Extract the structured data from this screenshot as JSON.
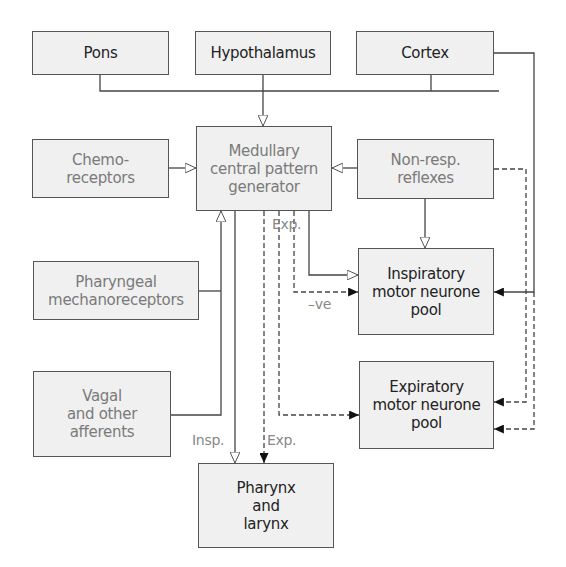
{
  "diagram": {
    "type": "flowchart",
    "nodes": {
      "pons": {
        "lines": [
          "Pons"
        ]
      },
      "hypothalamus": {
        "lines": [
          "Hypothalamus"
        ]
      },
      "cortex": {
        "lines": [
          "Cortex"
        ]
      },
      "cpg": {
        "lines": [
          "Medullary",
          "central pattern",
          "generator"
        ]
      },
      "chemoreceptors": {
        "lines": [
          "Chemo-",
          "receptors"
        ]
      },
      "nonresp": {
        "lines": [
          "Non-resp.",
          "reflexes"
        ]
      },
      "pharyngeal": {
        "lines": [
          "Pharyngeal",
          "mechanoreceptors"
        ]
      },
      "vagal": {
        "lines": [
          "Vagal",
          "and other",
          "afferents"
        ]
      },
      "inspiratory": {
        "lines": [
          "Inspiratory",
          "motor neurone",
          "pool"
        ]
      },
      "expiratory": {
        "lines": [
          "Expiratory",
          "motor neurone",
          "pool"
        ]
      },
      "pharynx": {
        "lines": [
          "Pharynx",
          "and",
          "larynx"
        ]
      }
    },
    "labels": {
      "exp_upper": "Exp.",
      "neg": "–ve",
      "insp_lower": "Insp.",
      "exp_lower": "Exp."
    },
    "edges": [
      {
        "from": "pons",
        "to": "cpg",
        "style": "solid",
        "head": "open"
      },
      {
        "from": "hypothalamus",
        "to": "cpg",
        "style": "solid",
        "head": "open"
      },
      {
        "from": "cortex",
        "to": "cpg",
        "style": "solid",
        "head": "open"
      },
      {
        "from": "chemoreceptors",
        "to": "cpg",
        "style": "solid",
        "head": "open"
      },
      {
        "from": "nonresp",
        "to": "cpg",
        "style": "solid",
        "head": "open"
      },
      {
        "from": "pharyngeal",
        "to": "cpg",
        "style": "solid",
        "head": "open"
      },
      {
        "from": "vagal",
        "to": "cpg",
        "style": "solid",
        "head": "open"
      },
      {
        "from": "nonresp",
        "to": "inspiratory",
        "style": "solid",
        "head": "open"
      },
      {
        "from": "cpg",
        "to": "inspiratory",
        "style": "solid",
        "head": "open"
      },
      {
        "from": "cpg",
        "to": "inspiratory",
        "style": "dashed",
        "head": "filled",
        "label": "Exp. / –ve"
      },
      {
        "from": "cortex",
        "to": "inspiratory",
        "style": "solid",
        "head": "filled"
      },
      {
        "from": "cpg",
        "to": "expiratory",
        "style": "dashed",
        "head": "filled"
      },
      {
        "from": "nonresp",
        "to": "expiratory",
        "style": "dashed",
        "head": "filled"
      },
      {
        "from": "cortex",
        "to": "expiratory",
        "style": "dashed",
        "head": "filled"
      },
      {
        "from": "cpg",
        "to": "pharynx",
        "style": "solid",
        "head": "open",
        "label": "Insp."
      },
      {
        "from": "cpg",
        "to": "pharynx",
        "style": "dashed",
        "head": "filled",
        "label": "Exp."
      }
    ],
    "colors": {
      "box_fill": "#f0f0f0",
      "box_border": "#555555",
      "line": "#444444",
      "text_dark": "#222222",
      "text_light": "#7a7a7a"
    }
  }
}
